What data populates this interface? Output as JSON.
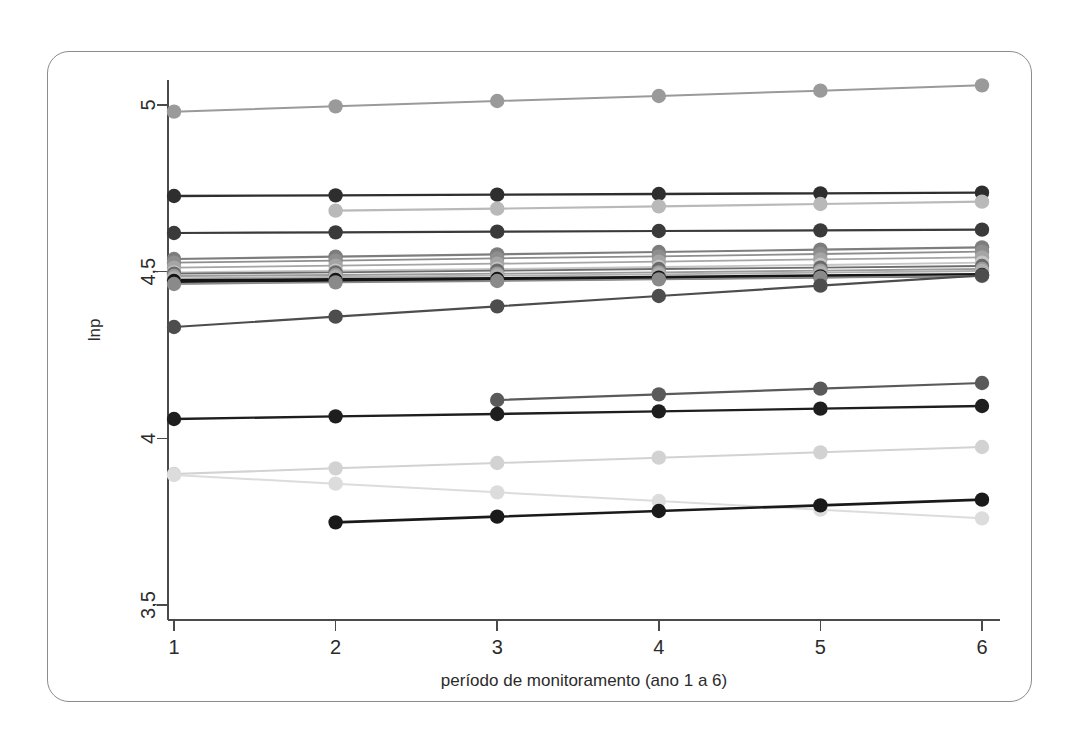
{
  "figure": {
    "frame_color": "#8c8c8c",
    "background": "#ffffff"
  },
  "axis": {
    "y_title": "lnp",
    "x_title": "período de monitoramento (ano 1 a 6)",
    "y_ticks": [
      "3,5",
      "4",
      "4,5",
      "5"
    ],
    "x_ticks": [
      "1",
      "2",
      "3",
      "4",
      "5",
      "6"
    ]
  },
  "chart_data": {
    "type": "line",
    "title": "",
    "xlabel": "período de monitoramento (ano 1 a 6)",
    "ylabel": "lnp",
    "x": [
      1,
      2,
      3,
      4,
      5,
      6
    ],
    "xlim": [
      0.8,
      6.25
    ],
    "ylim": [
      3.5,
      5.08
    ],
    "grid": false,
    "legend": "none",
    "marker": "filled-circle",
    "xtick_labels": [
      "1",
      "2",
      "3",
      "4",
      "5",
      "6"
    ],
    "ytick_values": [
      3.5,
      4.0,
      4.5,
      5.0
    ],
    "ytick_labels": [
      "3,5",
      "4",
      "4,5",
      "5"
    ],
    "series": [
      {
        "name": "s01",
        "color": "#9a9a9a",
        "width": 2.0,
        "x": [
          1,
          2,
          3,
          4,
          5,
          6
        ],
        "values": [
          4.98,
          4.996,
          5.012,
          5.027,
          5.043,
          5.059
        ]
      },
      {
        "name": "s02",
        "color": "#2e2e2e",
        "width": 2.4,
        "x": [
          1,
          2,
          3,
          4,
          5,
          6
        ],
        "values": [
          4.727,
          4.729,
          4.731,
          4.733,
          4.735,
          4.737
        ]
      },
      {
        "name": "s03",
        "color": "#b9b9b9",
        "width": 2.2,
        "x": [
          2,
          3,
          4,
          5,
          6
        ],
        "values": [
          4.683,
          4.689,
          4.696,
          4.703,
          4.71
        ]
      },
      {
        "name": "s04",
        "color": "#3a3a3a",
        "width": 2.2,
        "x": [
          1,
          2,
          3,
          4,
          5,
          6
        ],
        "values": [
          4.616,
          4.618,
          4.62,
          4.622,
          4.624,
          4.626
        ]
      },
      {
        "name": "s05",
        "color": "#7d7d7d",
        "width": 2.2,
        "x": [
          1,
          2,
          3,
          4,
          5,
          6
        ],
        "values": [
          4.538,
          4.545,
          4.552,
          4.559,
          4.566,
          4.573
        ]
      },
      {
        "name": "s06",
        "color": "#8e8e8e",
        "width": 1.8,
        "x": [
          1,
          2,
          3,
          4,
          5,
          6
        ],
        "values": [
          4.527,
          4.533,
          4.54,
          4.546,
          4.553,
          4.56
        ]
      },
      {
        "name": "s07",
        "color": "#a5a5a5",
        "width": 1.8,
        "x": [
          1,
          2,
          3,
          4,
          5,
          6
        ],
        "values": [
          4.512,
          4.518,
          4.524,
          4.53,
          4.537,
          4.543
        ]
      },
      {
        "name": "s08",
        "color": "#c6c6c6",
        "width": 1.8,
        "x": [
          1,
          2,
          3,
          4,
          5,
          6
        ],
        "values": [
          4.498,
          4.503,
          4.508,
          4.514,
          4.52,
          4.527
        ]
      },
      {
        "name": "s09",
        "color": "#6b6b6b",
        "width": 1.8,
        "x": [
          1,
          2,
          3,
          4,
          5,
          6
        ],
        "values": [
          4.494,
          4.498,
          4.503,
          4.508,
          4.512,
          4.517
        ]
      },
      {
        "name": "s10",
        "color": "#9c9c9c",
        "width": 1.8,
        "x": [
          1,
          2,
          3,
          4,
          5,
          6
        ],
        "values": [
          4.487,
          4.49,
          4.494,
          4.498,
          4.503,
          4.508
        ]
      },
      {
        "name": "s11",
        "color": "#b0b0b0",
        "width": 1.8,
        "x": [
          1,
          2,
          3,
          4,
          5,
          6
        ],
        "values": [
          4.48,
          4.484,
          4.488,
          4.492,
          4.497,
          4.502
        ]
      },
      {
        "name": "s12",
        "color": "#151515",
        "width": 4.0,
        "x": [
          1,
          2,
          3,
          4,
          5,
          6
        ],
        "values": [
          4.472,
          4.475,
          4.478,
          4.482,
          4.486,
          4.49
        ]
      },
      {
        "name": "s13",
        "color": "#8a8a8a",
        "width": 1.8,
        "x": [
          1,
          2,
          3,
          4,
          5,
          6
        ],
        "values": [
          4.463,
          4.468,
          4.472,
          4.477,
          4.482,
          4.487
        ]
      },
      {
        "name": "s14",
        "color": "#4d4d4d",
        "width": 2.2,
        "x": [
          1,
          2,
          3,
          4,
          5,
          6
        ],
        "values": [
          4.334,
          4.365,
          4.396,
          4.427,
          4.458,
          4.489
        ]
      },
      {
        "name": "s15",
        "color": "#5a5a5a",
        "width": 2.2,
        "x": [
          3,
          4,
          5,
          6
        ],
        "values": [
          4.115,
          4.132,
          4.149,
          4.166
        ]
      },
      {
        "name": "s16",
        "color": "#1e1e1e",
        "width": 2.4,
        "x": [
          1,
          2,
          3,
          4,
          5,
          6
        ],
        "values": [
          4.058,
          4.066,
          4.073,
          4.081,
          4.089,
          4.097
        ]
      },
      {
        "name": "s17",
        "color": "#d2d2d2",
        "width": 2.0,
        "x": [
          1,
          2,
          3,
          4,
          5,
          6
        ],
        "values": [
          3.893,
          3.91,
          3.926,
          3.942,
          3.958,
          3.974
        ]
      },
      {
        "name": "s18",
        "color": "#dcdcdc",
        "width": 2.0,
        "x": [
          1,
          2,
          3,
          4,
          5,
          6
        ],
        "values": [
          3.89,
          3.864,
          3.838,
          3.812,
          3.786,
          3.76
        ]
      },
      {
        "name": "s19",
        "color": "#1a1a1a",
        "width": 2.6,
        "x": [
          2,
          3,
          4,
          5,
          6
        ],
        "values": [
          3.748,
          3.765,
          3.782,
          3.799,
          3.816
        ]
      }
    ]
  }
}
